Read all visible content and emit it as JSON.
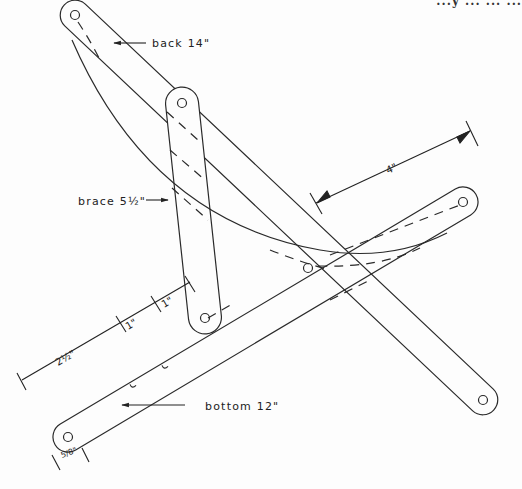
{
  "header": {
    "clipped_text": "...y ... ... ..."
  },
  "diagram": {
    "stroke_color": "#2a2a2a",
    "background": "#fdfdfd",
    "parts": [
      {
        "id": "back",
        "label": "back 14\"",
        "length_in": 14
      },
      {
        "id": "brace",
        "label": "brace 5½\"",
        "length_in": 5.5
      },
      {
        "id": "bottom",
        "label": "bottom 12\"",
        "length_in": 12
      }
    ],
    "dimensions": [
      {
        "id": "dim-4",
        "label": "4\""
      },
      {
        "id": "dim-2-5",
        "label": "2½\""
      },
      {
        "id": "dim-1a",
        "label": "1\""
      },
      {
        "id": "dim-1b",
        "label": "1\""
      },
      {
        "id": "dim-5-8",
        "label": "5/8\""
      }
    ]
  }
}
